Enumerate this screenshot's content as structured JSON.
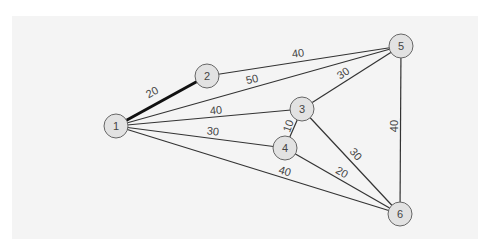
{
  "graph": {
    "nodes": [
      {
        "id": "1",
        "x": 116,
        "y": 126
      },
      {
        "id": "2",
        "x": 207,
        "y": 76
      },
      {
        "id": "3",
        "x": 302,
        "y": 109
      },
      {
        "id": "4",
        "x": 285,
        "y": 148
      },
      {
        "id": "5",
        "x": 401,
        "y": 46
      },
      {
        "id": "6",
        "x": 400,
        "y": 214
      }
    ],
    "edges": [
      {
        "from": "1",
        "to": "2",
        "weight": "20",
        "bold": true,
        "lx": 152,
        "ly": 92,
        "rot": -29
      },
      {
        "from": "2",
        "to": "5",
        "weight": "40",
        "bold": false,
        "lx": 298,
        "ly": 53,
        "rot": -8
      },
      {
        "from": "1",
        "to": "5",
        "weight": "50",
        "bold": false,
        "lx": 252,
        "ly": 79,
        "rot": -14
      },
      {
        "from": "1",
        "to": "3",
        "weight": "40",
        "bold": false,
        "lx": 216,
        "ly": 110,
        "rot": -5
      },
      {
        "from": "3",
        "to": "5",
        "weight": "30",
        "bold": false,
        "lx": 343,
        "ly": 73,
        "rot": -33
      },
      {
        "from": "1",
        "to": "4",
        "weight": "30",
        "bold": false,
        "lx": 213,
        "ly": 131,
        "rot": 6
      },
      {
        "from": "3",
        "to": "4",
        "weight": "10",
        "bold": false,
        "lx": 288,
        "ly": 126,
        "rot": -70
      },
      {
        "from": "3",
        "to": "6",
        "weight": "30",
        "bold": false,
        "lx": 356,
        "ly": 154,
        "rot": 48
      },
      {
        "from": "4",
        "to": "6",
        "weight": "20",
        "bold": false,
        "lx": 342,
        "ly": 172,
        "rot": 30
      },
      {
        "from": "1",
        "to": "6",
        "weight": "40",
        "bold": false,
        "lx": 285,
        "ly": 171,
        "rot": 17
      },
      {
        "from": "5",
        "to": "6",
        "weight": "40",
        "bold": false,
        "lx": 394,
        "ly": 126,
        "rot": -90
      }
    ]
  }
}
